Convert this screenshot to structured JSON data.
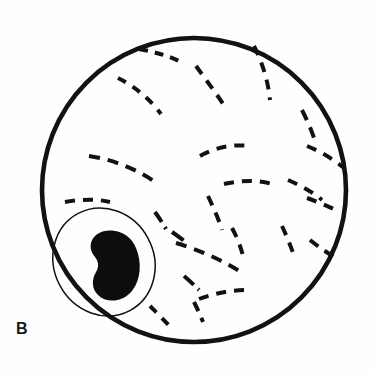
{
  "figure": {
    "domain": "diagram",
    "panel_label": "B",
    "width": 373,
    "height": 374,
    "background_color": "#fefefe",
    "ink_color": "#121212",
    "description_kind": "line-drawing"
  },
  "chart_data": {
    "type": "diagram",
    "title": "",
    "xlabel": "",
    "ylabel": "",
    "annotations": [
      "B"
    ],
    "legend": [],
    "shapes": [
      {
        "name": "cell-outline-circle",
        "kind": "circle",
        "cx": 194,
        "cy": 190,
        "r": 152,
        "stroke": "#121212",
        "stroke_width": 4.6,
        "fill": "none"
      },
      {
        "name": "nucleus-oval-outline",
        "kind": "ellipse",
        "cx": 104,
        "cy": 262,
        "rx": 50,
        "ry": 55,
        "rotation_deg": -28,
        "stroke": "#121212",
        "stroke_width": 1.5,
        "fill": "none"
      },
      {
        "name": "nucleus-body",
        "kind": "blob",
        "path": "M 136 248 C 142 262 141 280 132 291 C 122 303 106 303 98 295 C 91 288 92 279 96 272 C 99 267 99 262 95 257 C 89 250 89 241 96 235 C 105 228 119 230 127 236 C 131 239 134 243 136 248 Z",
        "fill": "#0d0d0d",
        "stroke": "none"
      }
    ],
    "dashed_strokes": [
      {
        "name": "fiber-1",
        "path": "M 139 49 C 155 52 170 56 183 63",
        "dash": "9 7"
      },
      {
        "name": "fiber-2",
        "path": "M 118 78 C 134 86 150 99 161 114",
        "dash": "9 8"
      },
      {
        "name": "fiber-3",
        "path": "M 196 66 C 206 80 217 94 227 110",
        "dash": "10 8"
      },
      {
        "name": "fiber-4",
        "path": "M 254 46 C 262 62 268 80 270 100",
        "dash": "10 8"
      },
      {
        "name": "fiber-5",
        "path": "M 302 110 C 307 120 311 129 314 138",
        "dash": "11 8"
      },
      {
        "name": "fiber-6",
        "path": "M 89 156 C 116 160 140 171 158 184",
        "dash": "11 8"
      },
      {
        "name": "fiber-7",
        "path": "M 200 156 C 216 147 234 144 248 146",
        "dash": "10 8"
      },
      {
        "name": "fiber-8",
        "path": "M 307 146 C 322 152 334 160 344 168",
        "dash": "10 8"
      },
      {
        "name": "fiber-9",
        "path": "M 224 184 C 242 180 259 180 272 184",
        "dash": "10 8"
      },
      {
        "name": "fiber-10",
        "path": "M 288 180 C 302 186 314 193 322 200",
        "dash": "10 8"
      },
      {
        "name": "fiber-11",
        "path": "M 65 202 C 82 199 98 199 110 202",
        "dash": "10 8"
      },
      {
        "name": "fiber-12",
        "path": "M 208 196 C 214 209 219 220 222 230",
        "dash": "10 8"
      },
      {
        "name": "fiber-13",
        "path": "M 307 198 C 321 203 332 208 340 212",
        "dash": "10 8"
      },
      {
        "name": "fiber-14",
        "path": "M 155 212 C 160 219 163 224 166 229",
        "dash": "12 6"
      },
      {
        "name": "fiber-15",
        "path": "M 232 228 C 238 239 241 248 243 256",
        "dash": "10 8"
      },
      {
        "name": "fiber-16",
        "path": "M 282 226 C 288 239 292 250 295 258",
        "dash": "10 8"
      },
      {
        "name": "fiber-17",
        "path": "M 310 240 C 320 248 329 254 336 258",
        "dash": "10 8"
      },
      {
        "name": "fiber-18",
        "path": "M 176 243 C 200 250 224 261 244 274",
        "dash": "11 8"
      },
      {
        "name": "fiber-19",
        "path": "M 199 299 C 215 293 232 290 246 290",
        "dash": "10 8"
      },
      {
        "name": "fiber-20",
        "path": "M 194 302 C 198 310 201 317 203 322",
        "dash": "10 7"
      },
      {
        "name": "fiber-21",
        "path": "M 150 306 C 158 314 166 322 173 330",
        "dash": "9 8"
      },
      {
        "name": "fiber-22",
        "path": "M 172 232 C 178 236 183 240 187 243",
        "dash": "14 6"
      },
      {
        "name": "fiber-23",
        "path": "M 184 276 C 190 281 195 286 199 290",
        "dash": "13 6"
      }
    ]
  }
}
